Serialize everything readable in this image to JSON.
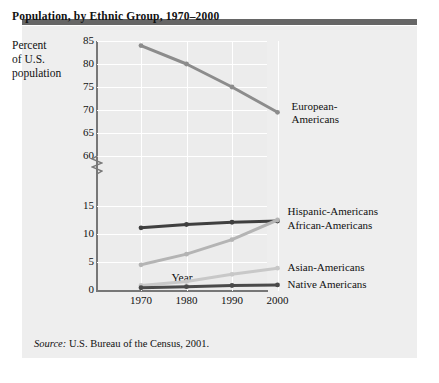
{
  "title": "Population, by Ethnic Group, 1970–2000",
  "y_axis_title": "Percent\nof U.S.\npopulation",
  "y_axis_title_lines": [
    "Percent",
    "of U.S.",
    "population"
  ],
  "source": "Source: U.S. Bureau of the Census, 2001.",
  "source_prefix": "Source:",
  "source_rest": " U.S. Bureau of the Census, 2001.",
  "colors": {
    "topbar": "#666666",
    "card_background": "#eeeeee",
    "plot_background": "#ececec",
    "gridline": "#ffffff",
    "axis": "#777777",
    "european": "#8c8c8c",
    "african": "#3f3f3f",
    "hispanic": "#b4b4b4",
    "asian": "#c8c8c8",
    "native": "#4a4a4a",
    "text": "#111111"
  },
  "chart_data": {
    "type": "line",
    "title": "Population, by Ethnic Group, 1970–2000",
    "xlabel": "Year",
    "ylabel": "Percent of U.S. population",
    "categories": [
      "1970",
      "1980",
      "1990",
      "2000"
    ],
    "x": [
      1970,
      1980,
      1990,
      2000
    ],
    "grid": true,
    "legend_position": "right-inline",
    "axis_break": true,
    "axis_break_between": [
      15,
      60
    ],
    "yticks_upper": [
      85,
      80,
      75,
      70,
      65,
      60
    ],
    "yticks_lower": [
      15,
      10,
      5,
      0
    ],
    "ylim_upper": [
      60,
      85
    ],
    "ylim_lower": [
      0,
      15
    ],
    "series": [
      {
        "name": "European-Americans",
        "label_lines": [
          "European-",
          "Americans"
        ],
        "color": "#8c8c8c",
        "values": [
          84,
          80,
          75,
          69.5
        ]
      },
      {
        "name": "African-Americans",
        "label_lines": [
          "African-Americans"
        ],
        "color": "#3f3f3f",
        "values": [
          11.1,
          11.7,
          12.1,
          12.3
        ]
      },
      {
        "name": "Hispanic-Americans",
        "label_lines": [
          "Hispanic-Americans"
        ],
        "color": "#b4b4b4",
        "values": [
          4.5,
          6.4,
          9.0,
          12.5
        ]
      },
      {
        "name": "Asian-Americans",
        "label_lines": [
          "Asian-Americans"
        ],
        "color": "#c8c8c8",
        "values": [
          0.8,
          1.5,
          2.8,
          3.9
        ]
      },
      {
        "name": "Native Americans",
        "label_lines": [
          "Native Americans"
        ],
        "color": "#4a4a4a",
        "values": [
          0.4,
          0.6,
          0.8,
          0.9
        ]
      }
    ]
  },
  "series_labels": {
    "european_line1": "European-",
    "european_line2": "Americans",
    "hispanic": "Hispanic-Americans",
    "african": "African-Americans",
    "asian": "Asian-Americans",
    "native": "Native Americans"
  },
  "xlabel": "Year"
}
